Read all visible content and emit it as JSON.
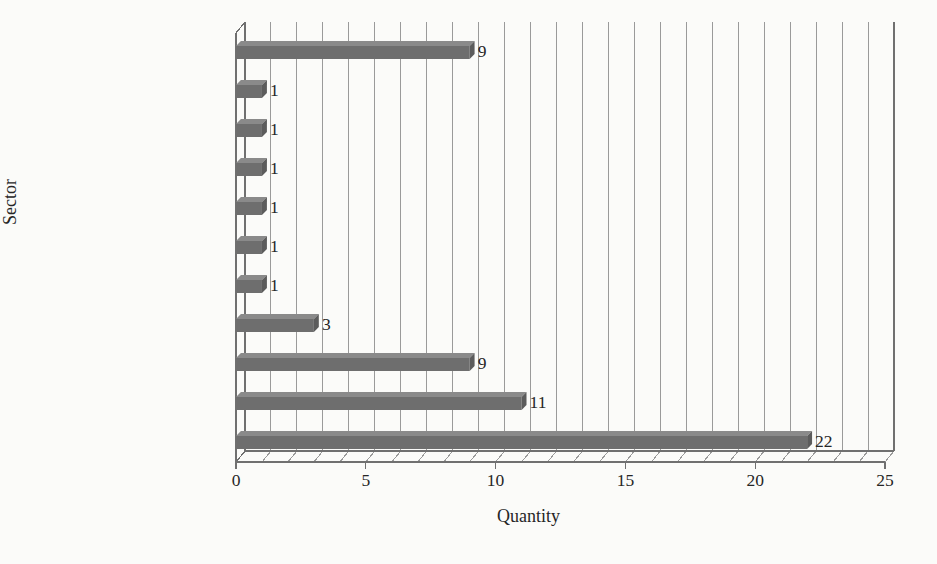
{
  "chart_data": {
    "type": "bar",
    "orientation": "horizontal",
    "title": "",
    "xlabel": "Quantity",
    "ylabel": "Sector",
    "categories": [
      "Not Reported",
      "Other",
      "Air Conditioning",
      "Office Items",
      "Concrete",
      "Medical",
      "Services",
      "Textile",
      "Plastics",
      "Electronic",
      "Automotive"
    ],
    "values": [
      9,
      1,
      1,
      1,
      1,
      1,
      1,
      3,
      9,
      11,
      22
    ],
    "data_labels": [
      "9",
      "1",
      "1",
      "1",
      "1",
      "1",
      "1",
      "3",
      "9",
      "11",
      "22"
    ],
    "xlim": [
      0,
      25
    ],
    "xticks": [
      0,
      5,
      10,
      15,
      20,
      25
    ],
    "xtick_labels": [
      "0",
      "5",
      "10",
      "15",
      "20",
      "25"
    ],
    "minor_gridline_step": 1,
    "grid": true,
    "grid_orientation": "vertical",
    "legend": "none",
    "bar_color": "#6e6e6e",
    "grid_color": "#9a9a9a",
    "axis_color": "#707070",
    "background_color": "#fbfbf9",
    "text_color": "#262626"
  }
}
